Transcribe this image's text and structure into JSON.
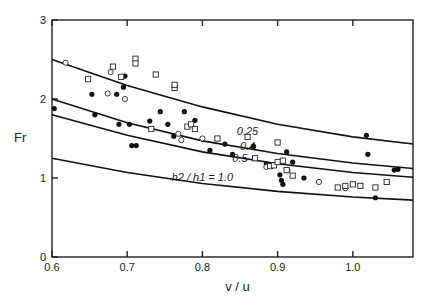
{
  "chart_data": {
    "type": "scatter",
    "title": "",
    "xlabel": "v / u",
    "ylabel": "Fr",
    "xlim": [
      0.6,
      1.08
    ],
    "ylim": [
      0,
      3
    ],
    "xticks": [
      0.6,
      0.7,
      0.8,
      0.9,
      1.0
    ],
    "xtick_labels": [
      "0.6",
      "0.7",
      "0.8",
      "0.9",
      "1.0"
    ],
    "yticks": [
      0,
      1,
      2,
      3
    ],
    "ytick_labels": [
      "0",
      "1",
      "2",
      "3"
    ],
    "grid": false,
    "legend": null,
    "curves": [
      {
        "name": "h2/h1 = 0.25",
        "label": "0.25",
        "label_pos": [
          0.86,
          1.55
        ],
        "x": [
          0.6,
          0.7,
          0.8,
          0.9,
          1.0,
          1.08
        ],
        "y": [
          2.5,
          2.17,
          1.9,
          1.68,
          1.52,
          1.43
        ]
      },
      {
        "name": "h2/h1 = 0.4",
        "label": "0.4",
        "label_pos": [
          0.86,
          1.35
        ],
        "x": [
          0.6,
          0.7,
          0.8,
          0.9,
          1.0,
          1.08
        ],
        "y": [
          2.0,
          1.7,
          1.47,
          1.31,
          1.19,
          1.12
        ]
      },
      {
        "name": "h2/h1 = 0.5",
        "label": "0.5",
        "label_pos": [
          0.85,
          1.2
        ],
        "x": [
          0.6,
          0.7,
          0.8,
          0.9,
          1.0,
          1.08
        ],
        "y": [
          1.8,
          1.54,
          1.33,
          1.18,
          1.07,
          1.01
        ]
      },
      {
        "name": "h2/h1 = 1.0",
        "label": "h2 / h1 = 1.0",
        "label_pos": [
          0.8,
          0.96
        ],
        "x": [
          0.6,
          0.7,
          0.8,
          0.9,
          1.0,
          1.08
        ],
        "y": [
          1.25,
          1.07,
          0.93,
          0.83,
          0.76,
          0.72
        ]
      }
    ],
    "series": [
      {
        "name": "filled circles",
        "marker": "filled-circle",
        "points": [
          [
            0.603,
            1.88
          ],
          [
            0.653,
            2.06
          ],
          [
            0.657,
            1.8
          ],
          [
            0.686,
            2.06
          ],
          [
            0.695,
            2.15
          ],
          [
            0.697,
            2.29
          ],
          [
            0.689,
            1.68
          ],
          [
            0.703,
            1.68
          ],
          [
            0.706,
            1.41
          ],
          [
            0.712,
            1.41
          ],
          [
            0.73,
            1.72
          ],
          [
            0.744,
            1.84
          ],
          [
            0.754,
            1.68
          ],
          [
            0.762,
            1.53
          ],
          [
            0.776,
            1.84
          ],
          [
            0.79,
            1.73
          ],
          [
            0.81,
            1.35
          ],
          [
            0.83,
            1.43
          ],
          [
            0.84,
            1.3
          ],
          [
            0.868,
            1.4
          ],
          [
            0.885,
            1.18
          ],
          [
            0.903,
            1.04
          ],
          [
            0.905,
            0.97
          ],
          [
            0.907,
            0.92
          ],
          [
            0.92,
            1.2
          ],
          [
            0.935,
            1.0
          ],
          [
            0.912,
            1.33
          ],
          [
            1.018,
            1.54
          ],
          [
            1.02,
            1.3
          ],
          [
            1.055,
            1.1
          ],
          [
            1.06,
            1.11
          ],
          [
            1.03,
            0.75
          ]
        ]
      },
      {
        "name": "open circles",
        "marker": "open-circle",
        "points": [
          [
            0.618,
            2.46
          ],
          [
            0.674,
            2.07
          ],
          [
            0.678,
            2.34
          ],
          [
            0.697,
            2.0
          ],
          [
            0.768,
            1.56
          ],
          [
            0.8,
            1.5
          ],
          [
            0.772,
            1.48
          ],
          [
            0.885,
            1.14
          ],
          [
            0.955,
            0.95
          ],
          [
            0.99,
            0.87
          ],
          [
            0.913,
            1.1
          ]
        ]
      },
      {
        "name": "open squares",
        "marker": "open-square",
        "points": [
          [
            0.648,
            2.25
          ],
          [
            0.681,
            2.41
          ],
          [
            0.692,
            2.28
          ],
          [
            0.711,
            2.51
          ],
          [
            0.711,
            2.45
          ],
          [
            0.738,
            2.31
          ],
          [
            0.763,
            2.14
          ],
          [
            0.763,
            2.18
          ],
          [
            0.732,
            1.62
          ],
          [
            0.78,
            1.65
          ],
          [
            0.785,
            1.68
          ],
          [
            0.79,
            1.62
          ],
          [
            0.82,
            1.5
          ],
          [
            0.86,
            1.52
          ],
          [
            0.9,
            1.45
          ],
          [
            0.87,
            1.25
          ],
          [
            0.89,
            1.15
          ],
          [
            0.895,
            1.16
          ],
          [
            0.9,
            1.2
          ],
          [
            0.907,
            1.22
          ],
          [
            0.912,
            1.1
          ],
          [
            0.92,
            1.03
          ],
          [
            0.98,
            0.88
          ],
          [
            0.99,
            0.9
          ],
          [
            1.0,
            0.92
          ],
          [
            1.01,
            0.9
          ],
          [
            1.03,
            0.88
          ],
          [
            1.045,
            0.95
          ]
        ]
      }
    ]
  }
}
